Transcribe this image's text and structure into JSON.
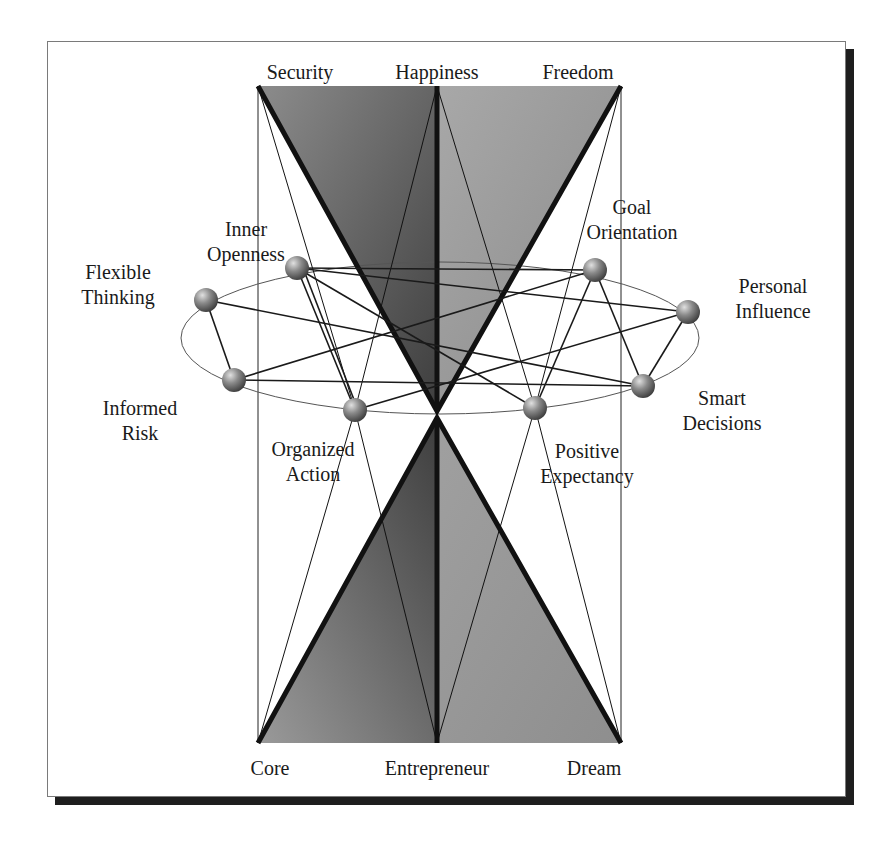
{
  "diagram": {
    "top_labels": [
      {
        "id": "security",
        "text": "Security",
        "x": 258,
        "y": 86
      },
      {
        "id": "happiness",
        "text": "Happiness",
        "x": 437,
        "y": 86
      },
      {
        "id": "freedom",
        "text": "Freedom",
        "x": 621,
        "y": 86
      }
    ],
    "bottom_labels": [
      {
        "id": "core",
        "text": "Core",
        "x": 258,
        "y": 743
      },
      {
        "id": "entrepreneur",
        "text": "Entrepreneur",
        "x": 437,
        "y": 743
      },
      {
        "id": "dream",
        "text": "Dream",
        "x": 621,
        "y": 743
      }
    ],
    "nodes": [
      {
        "id": "inner-openness",
        "lines": [
          "Inner",
          "Openness"
        ],
        "x": 297,
        "y": 268
      },
      {
        "id": "flexible-thinking",
        "lines": [
          "Flexible",
          "Thinking"
        ],
        "x": 206,
        "y": 300
      },
      {
        "id": "informed-risk",
        "lines": [
          "Informed",
          "Risk"
        ],
        "x": 234,
        "y": 380
      },
      {
        "id": "organized-action",
        "lines": [
          "Organized",
          "Action"
        ],
        "x": 355,
        "y": 410
      },
      {
        "id": "positive-expectancy",
        "lines": [
          "Positive",
          "Expectancy"
        ],
        "x": 535,
        "y": 408
      },
      {
        "id": "smart-decisions",
        "lines": [
          "Smart",
          "Decisions"
        ],
        "x": 643,
        "y": 386
      },
      {
        "id": "personal-influence",
        "lines": [
          "Personal",
          "Influence"
        ],
        "x": 688,
        "y": 312
      },
      {
        "id": "goal-orientation",
        "lines": [
          "Goal",
          "Orientation"
        ],
        "x": 595,
        "y": 270
      }
    ],
    "colors": {
      "left_triangle": "#5a5a5a",
      "right_triangle": "#9a9a9a",
      "outline": "#111111",
      "sphere": "#8a8a8a"
    }
  }
}
